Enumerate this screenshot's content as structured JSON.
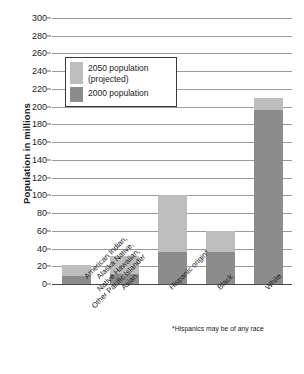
{
  "chart_data": {
    "type": "bar",
    "title": "",
    "xlabel": "",
    "ylabel": "Population in millions",
    "ylim": [
      0,
      300
    ],
    "ytick_step": 20,
    "yticks": [
      0,
      20,
      40,
      60,
      80,
      100,
      120,
      140,
      160,
      180,
      200,
      220,
      240,
      260,
      280,
      300
    ],
    "grid": true,
    "legend_position": "upper-left-inside",
    "categories": [
      "American Indian,\nAlaska Native,\nNative Hawaiian,\nOther Pacific Islander",
      "Asian",
      "Hispanic origin*",
      "Black",
      "White"
    ],
    "series": [
      {
        "name": "2050 population\n(projected)",
        "color": "#bdbdbd",
        "values": [
          21,
          32,
          100,
          60,
          210
        ]
      },
      {
        "name": "2000 population",
        "color": "#8c8c8c",
        "values": [
          9,
          11,
          36,
          36,
          196
        ]
      }
    ],
    "annotations": [
      "*Hispanics may be of any race"
    ],
    "note": "Stacked/overlaid bars: the 2000 population dark segment is drawn in front of the full-height 2050 projected bar."
  },
  "legend": {
    "items": [
      {
        "label": "2050 population\n(projected)",
        "color": "#bdbdbd"
      },
      {
        "label": "2000 population",
        "color": "#8c8c8c"
      }
    ]
  },
  "footnote": "*Hispanics may be of any race",
  "axis": {
    "y_title": "Population in millions"
  },
  "colors": {
    "bar_2050": "#bdbdbd",
    "bar_2000": "#8c8c8c",
    "gridline": "#9a9a9a",
    "axis": "#4a4a4a",
    "text": "#1a1a1a",
    "background": "#ffffff"
  }
}
